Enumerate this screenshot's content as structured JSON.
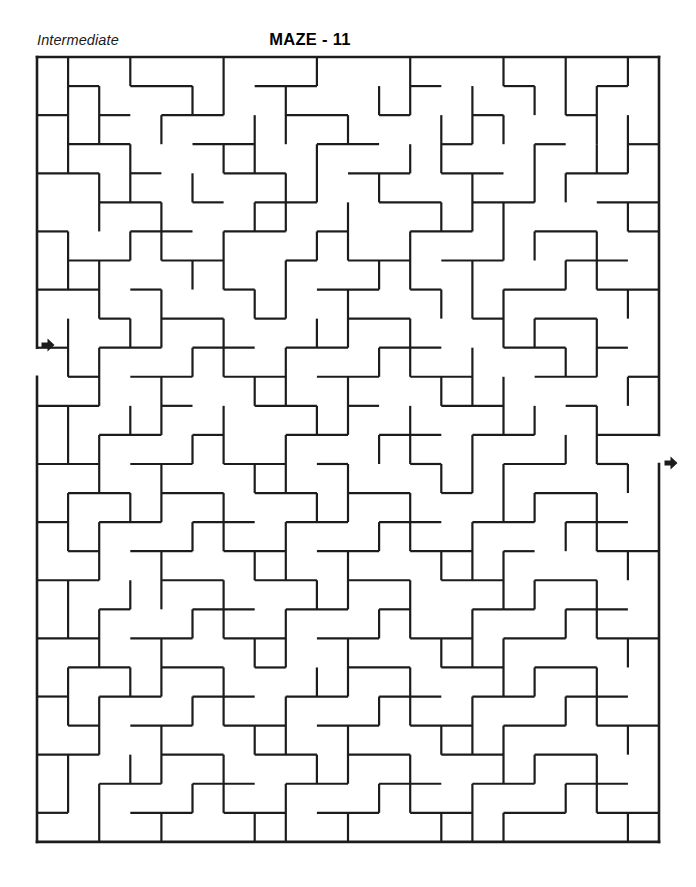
{
  "page": {
    "difficulty": "Intermediate",
    "title": "MAZE - 11",
    "background_color": "#ffffff",
    "ink_color": "#1c1c1c"
  },
  "maze": {
    "type": "rectangular-grid-maze",
    "columns": 20,
    "rows": 27,
    "cell_width": 31.1,
    "cell_height": 29.07,
    "origin_x": 37,
    "origin_y": 57,
    "wall_thickness": 2.2,
    "border_thickness": 2.6,
    "entrance": {
      "label": "entry-arrow",
      "side": "left",
      "row": 10,
      "x": 37,
      "y": 345
    },
    "exit": {
      "label": "exit-arrow",
      "side": "right",
      "row": 14,
      "x": 659,
      "y": 463
    },
    "border_segments": [
      [
        0,
        0,
        20,
        0
      ],
      [
        0,
        27,
        20,
        27
      ],
      [
        0,
        0,
        0,
        10
      ],
      [
        0,
        11,
        0,
        27
      ],
      [
        20,
        0,
        20,
        13
      ],
      [
        20,
        14,
        20,
        27
      ]
    ],
    "h_walls": [
      [
        1,
        1,
        2
      ],
      [
        3,
        1,
        5
      ],
      [
        7,
        1,
        9
      ],
      [
        12,
        1,
        13
      ],
      [
        15,
        1,
        16
      ],
      [
        18,
        1,
        19
      ],
      [
        0,
        2,
        1
      ],
      [
        2,
        2,
        3
      ],
      [
        4,
        2,
        6
      ],
      [
        8,
        2,
        10
      ],
      [
        11,
        2,
        12
      ],
      [
        14,
        2,
        15
      ],
      [
        17,
        2,
        18
      ],
      [
        1,
        3,
        3
      ],
      [
        5,
        3,
        7
      ],
      [
        9,
        3,
        11
      ],
      [
        13,
        3,
        14
      ],
      [
        16,
        3,
        17
      ],
      [
        19,
        3,
        20
      ],
      [
        0,
        4,
        2
      ],
      [
        3,
        4,
        4
      ],
      [
        6,
        4,
        8
      ],
      [
        10,
        4,
        12
      ],
      [
        13,
        4,
        15
      ],
      [
        17,
        4,
        19
      ],
      [
        2,
        5,
        4
      ],
      [
        5,
        5,
        6
      ],
      [
        7,
        5,
        9
      ],
      [
        11,
        5,
        13
      ],
      [
        14,
        5,
        16
      ],
      [
        18,
        5,
        20
      ],
      [
        0,
        6,
        1
      ],
      [
        3,
        6,
        5
      ],
      [
        6,
        6,
        8
      ],
      [
        9,
        6,
        10
      ],
      [
        12,
        6,
        14
      ],
      [
        16,
        6,
        18
      ],
      [
        19,
        6,
        20
      ],
      [
        1,
        7,
        3
      ],
      [
        4,
        7,
        6
      ],
      [
        8,
        7,
        9
      ],
      [
        10,
        7,
        12
      ],
      [
        13,
        7,
        15
      ],
      [
        17,
        7,
        19
      ],
      [
        0,
        8,
        2
      ],
      [
        3,
        8,
        4
      ],
      [
        6,
        8,
        7
      ],
      [
        9,
        8,
        11
      ],
      [
        12,
        8,
        13
      ],
      [
        15,
        8,
        17
      ],
      [
        18,
        8,
        20
      ],
      [
        2,
        9,
        3
      ],
      [
        4,
        9,
        6
      ],
      [
        7,
        9,
        8
      ],
      [
        10,
        9,
        12
      ],
      [
        14,
        9,
        15
      ],
      [
        16,
        9,
        18
      ],
      [
        0,
        10,
        1
      ],
      [
        2,
        10,
        4
      ],
      [
        5,
        10,
        7
      ],
      [
        8,
        10,
        10
      ],
      [
        11,
        10,
        13
      ],
      [
        15,
        10,
        17
      ],
      [
        18,
        10,
        19
      ],
      [
        1,
        11,
        2
      ],
      [
        3,
        11,
        5
      ],
      [
        6,
        11,
        8
      ],
      [
        9,
        11,
        11
      ],
      [
        12,
        11,
        14
      ],
      [
        16,
        11,
        18
      ],
      [
        19,
        11,
        20
      ],
      [
        0,
        12,
        2
      ],
      [
        4,
        12,
        5
      ],
      [
        7,
        12,
        9
      ],
      [
        10,
        12,
        11
      ],
      [
        13,
        12,
        15
      ],
      [
        17,
        12,
        18
      ],
      [
        2,
        13,
        4
      ],
      [
        5,
        13,
        6
      ],
      [
        8,
        13,
        10
      ],
      [
        11,
        13,
        13
      ],
      [
        14,
        13,
        16
      ],
      [
        18,
        13,
        20
      ],
      [
        0,
        14,
        2
      ],
      [
        3,
        14,
        5
      ],
      [
        6,
        14,
        8
      ],
      [
        9,
        14,
        10
      ],
      [
        12,
        14,
        13
      ],
      [
        15,
        14,
        17
      ],
      [
        18,
        14,
        19
      ],
      [
        1,
        15,
        3
      ],
      [
        4,
        15,
        6
      ],
      [
        7,
        15,
        9
      ],
      [
        10,
        15,
        12
      ],
      [
        13,
        15,
        14
      ],
      [
        16,
        15,
        18
      ],
      [
        0,
        16,
        1
      ],
      [
        2,
        16,
        4
      ],
      [
        5,
        16,
        7
      ],
      [
        8,
        16,
        10
      ],
      [
        11,
        16,
        13
      ],
      [
        14,
        16,
        16
      ],
      [
        17,
        16,
        19
      ],
      [
        1,
        17,
        2
      ],
      [
        3,
        17,
        5
      ],
      [
        6,
        17,
        8
      ],
      [
        9,
        17,
        11
      ],
      [
        12,
        17,
        14
      ],
      [
        15,
        17,
        16
      ],
      [
        18,
        17,
        20
      ],
      [
        0,
        18,
        2
      ],
      [
        4,
        18,
        6
      ],
      [
        7,
        18,
        9
      ],
      [
        10,
        18,
        12
      ],
      [
        13,
        18,
        15
      ],
      [
        16,
        18,
        18
      ],
      [
        2,
        19,
        3
      ],
      [
        5,
        19,
        7
      ],
      [
        8,
        19,
        10
      ],
      [
        11,
        19,
        12
      ],
      [
        14,
        19,
        16
      ],
      [
        17,
        19,
        19
      ],
      [
        0,
        20,
        2
      ],
      [
        3,
        20,
        5
      ],
      [
        6,
        20,
        8
      ],
      [
        9,
        20,
        11
      ],
      [
        12,
        20,
        14
      ],
      [
        15,
        20,
        17
      ],
      [
        18,
        20,
        20
      ],
      [
        1,
        21,
        3
      ],
      [
        4,
        21,
        6
      ],
      [
        7,
        21,
        8
      ],
      [
        10,
        21,
        12
      ],
      [
        13,
        21,
        15
      ],
      [
        16,
        21,
        18
      ],
      [
        0,
        22,
        1
      ],
      [
        2,
        22,
        4
      ],
      [
        5,
        22,
        7
      ],
      [
        8,
        22,
        10
      ],
      [
        11,
        22,
        13
      ],
      [
        14,
        22,
        16
      ],
      [
        17,
        22,
        19
      ],
      [
        1,
        23,
        2
      ],
      [
        3,
        23,
        5
      ],
      [
        6,
        23,
        8
      ],
      [
        9,
        23,
        11
      ],
      [
        12,
        23,
        14
      ],
      [
        15,
        23,
        17
      ],
      [
        18,
        23,
        20
      ],
      [
        0,
        24,
        2
      ],
      [
        4,
        24,
        6
      ],
      [
        7,
        24,
        9
      ],
      [
        10,
        24,
        12
      ],
      [
        13,
        24,
        15
      ],
      [
        16,
        24,
        18
      ],
      [
        2,
        25,
        4
      ],
      [
        5,
        25,
        7
      ],
      [
        8,
        25,
        10
      ],
      [
        11,
        25,
        13
      ],
      [
        14,
        25,
        16
      ],
      [
        17,
        25,
        19
      ],
      [
        0,
        26,
        1
      ],
      [
        3,
        26,
        5
      ],
      [
        6,
        26,
        8
      ],
      [
        9,
        26,
        11
      ],
      [
        12,
        26,
        14
      ],
      [
        15,
        26,
        17
      ],
      [
        18,
        26,
        20
      ]
    ],
    "v_walls": [
      [
        1,
        0,
        2
      ],
      [
        3,
        0,
        1
      ],
      [
        6,
        0,
        2
      ],
      [
        9,
        0,
        1
      ],
      [
        12,
        0,
        2
      ],
      [
        15,
        0,
        1
      ],
      [
        17,
        0,
        2
      ],
      [
        19,
        0,
        1
      ],
      [
        2,
        1,
        3
      ],
      [
        5,
        1,
        2
      ],
      [
        8,
        1,
        3
      ],
      [
        11,
        1,
        2
      ],
      [
        14,
        1,
        3
      ],
      [
        16,
        1,
        2
      ],
      [
        18,
        1,
        3
      ],
      [
        1,
        2,
        4
      ],
      [
        4,
        2,
        3
      ],
      [
        7,
        2,
        4
      ],
      [
        10,
        2,
        3
      ],
      [
        13,
        2,
        4
      ],
      [
        15,
        2,
        3
      ],
      [
        19,
        2,
        4
      ],
      [
        3,
        3,
        5
      ],
      [
        6,
        3,
        4
      ],
      [
        9,
        3,
        5
      ],
      [
        12,
        3,
        4
      ],
      [
        16,
        3,
        5
      ],
      [
        18,
        3,
        4
      ],
      [
        2,
        4,
        6
      ],
      [
        5,
        4,
        5
      ],
      [
        8,
        4,
        6
      ],
      [
        11,
        4,
        5
      ],
      [
        14,
        4,
        6
      ],
      [
        17,
        4,
        5
      ],
      [
        4,
        5,
        7
      ],
      [
        7,
        5,
        6
      ],
      [
        10,
        5,
        7
      ],
      [
        13,
        5,
        6
      ],
      [
        15,
        5,
        7
      ],
      [
        19,
        5,
        6
      ],
      [
        1,
        6,
        8
      ],
      [
        3,
        6,
        7
      ],
      [
        6,
        6,
        8
      ],
      [
        9,
        6,
        7
      ],
      [
        12,
        6,
        8
      ],
      [
        16,
        6,
        7
      ],
      [
        18,
        6,
        8
      ],
      [
        2,
        7,
        9
      ],
      [
        5,
        7,
        8
      ],
      [
        8,
        7,
        9
      ],
      [
        11,
        7,
        8
      ],
      [
        14,
        7,
        9
      ],
      [
        17,
        7,
        8
      ],
      [
        4,
        8,
        10
      ],
      [
        7,
        8,
        9
      ],
      [
        10,
        8,
        10
      ],
      [
        13,
        8,
        9
      ],
      [
        15,
        8,
        10
      ],
      [
        19,
        8,
        9
      ],
      [
        1,
        9,
        11
      ],
      [
        3,
        9,
        10
      ],
      [
        6,
        9,
        11
      ],
      [
        9,
        9,
        10
      ],
      [
        12,
        9,
        11
      ],
      [
        16,
        9,
        10
      ],
      [
        18,
        9,
        11
      ],
      [
        2,
        10,
        12
      ],
      [
        5,
        10,
        11
      ],
      [
        8,
        10,
        12
      ],
      [
        11,
        10,
        11
      ],
      [
        14,
        10,
        12
      ],
      [
        17,
        10,
        11
      ],
      [
        4,
        11,
        13
      ],
      [
        7,
        11,
        12
      ],
      [
        10,
        11,
        13
      ],
      [
        13,
        11,
        12
      ],
      [
        15,
        11,
        13
      ],
      [
        19,
        11,
        12
      ],
      [
        1,
        12,
        14
      ],
      [
        3,
        12,
        13
      ],
      [
        6,
        12,
        14
      ],
      [
        9,
        12,
        13
      ],
      [
        12,
        12,
        14
      ],
      [
        16,
        12,
        13
      ],
      [
        18,
        12,
        14
      ],
      [
        2,
        13,
        15
      ],
      [
        5,
        13,
        14
      ],
      [
        8,
        13,
        15
      ],
      [
        11,
        13,
        14
      ],
      [
        14,
        13,
        15
      ],
      [
        17,
        13,
        14
      ],
      [
        4,
        14,
        16
      ],
      [
        7,
        14,
        15
      ],
      [
        10,
        14,
        16
      ],
      [
        13,
        14,
        15
      ],
      [
        15,
        14,
        16
      ],
      [
        19,
        14,
        15
      ],
      [
        1,
        15,
        17
      ],
      [
        3,
        15,
        16
      ],
      [
        6,
        15,
        17
      ],
      [
        9,
        15,
        16
      ],
      [
        12,
        15,
        17
      ],
      [
        16,
        15,
        16
      ],
      [
        18,
        15,
        17
      ],
      [
        2,
        16,
        18
      ],
      [
        5,
        16,
        17
      ],
      [
        8,
        16,
        18
      ],
      [
        11,
        16,
        17
      ],
      [
        14,
        16,
        18
      ],
      [
        17,
        16,
        17
      ],
      [
        4,
        17,
        19
      ],
      [
        7,
        17,
        18
      ],
      [
        10,
        17,
        19
      ],
      [
        13,
        17,
        18
      ],
      [
        15,
        17,
        19
      ],
      [
        19,
        17,
        18
      ],
      [
        1,
        18,
        20
      ],
      [
        3,
        18,
        19
      ],
      [
        6,
        18,
        20
      ],
      [
        9,
        18,
        19
      ],
      [
        12,
        18,
        20
      ],
      [
        16,
        18,
        19
      ],
      [
        18,
        18,
        20
      ],
      [
        2,
        19,
        21
      ],
      [
        5,
        19,
        20
      ],
      [
        8,
        19,
        21
      ],
      [
        11,
        19,
        20
      ],
      [
        14,
        19,
        21
      ],
      [
        17,
        19,
        20
      ],
      [
        4,
        20,
        22
      ],
      [
        7,
        20,
        21
      ],
      [
        10,
        20,
        22
      ],
      [
        13,
        20,
        21
      ],
      [
        15,
        20,
        22
      ],
      [
        19,
        20,
        21
      ],
      [
        1,
        21,
        23
      ],
      [
        3,
        21,
        22
      ],
      [
        6,
        21,
        23
      ],
      [
        9,
        21,
        22
      ],
      [
        12,
        21,
        23
      ],
      [
        16,
        21,
        22
      ],
      [
        18,
        21,
        23
      ],
      [
        2,
        22,
        24
      ],
      [
        5,
        22,
        23
      ],
      [
        8,
        22,
        24
      ],
      [
        11,
        22,
        23
      ],
      [
        14,
        22,
        24
      ],
      [
        17,
        22,
        23
      ],
      [
        4,
        23,
        25
      ],
      [
        7,
        23,
        24
      ],
      [
        10,
        23,
        25
      ],
      [
        13,
        23,
        24
      ],
      [
        15,
        23,
        25
      ],
      [
        19,
        23,
        24
      ],
      [
        1,
        24,
        26
      ],
      [
        3,
        24,
        25
      ],
      [
        6,
        24,
        26
      ],
      [
        9,
        24,
        25
      ],
      [
        12,
        24,
        26
      ],
      [
        16,
        24,
        25
      ],
      [
        18,
        24,
        26
      ],
      [
        2,
        25,
        27
      ],
      [
        5,
        25,
        26
      ],
      [
        8,
        25,
        27
      ],
      [
        11,
        25,
        26
      ],
      [
        14,
        25,
        27
      ],
      [
        17,
        25,
        26
      ],
      [
        4,
        26,
        27
      ],
      [
        7,
        26,
        27
      ],
      [
        10,
        26,
        27
      ],
      [
        13,
        26,
        27
      ],
      [
        15,
        26,
        27
      ],
      [
        19,
        26,
        27
      ]
    ]
  }
}
